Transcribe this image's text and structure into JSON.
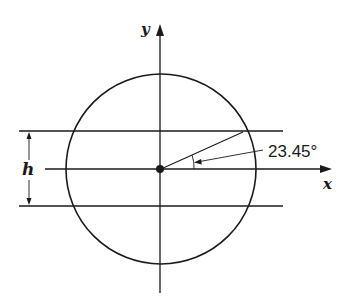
{
  "diagram": {
    "type": "circle-with-axes",
    "axes": {
      "x_label": "x",
      "y_label": "y"
    },
    "height_label": "h",
    "angle_label": "23.45°",
    "angle_degrees": 23.45,
    "colors": {
      "stroke": "#1a1a1a",
      "background": "#ffffff"
    }
  }
}
